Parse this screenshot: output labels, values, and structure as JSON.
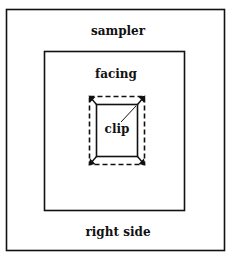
{
  "diagram": {
    "labels": {
      "sampler": "sampler",
      "facing": "facing",
      "clip": "clip",
      "right_side": "right side"
    },
    "regions": [
      {
        "name": "sampler",
        "style": "solid"
      },
      {
        "name": "facing",
        "style": "solid"
      },
      {
        "name": "fold-outline",
        "style": "dashed"
      },
      {
        "name": "clip",
        "style": "solid"
      }
    ],
    "colors": {
      "stroke": "#111111",
      "background": "#ffffff"
    }
  }
}
